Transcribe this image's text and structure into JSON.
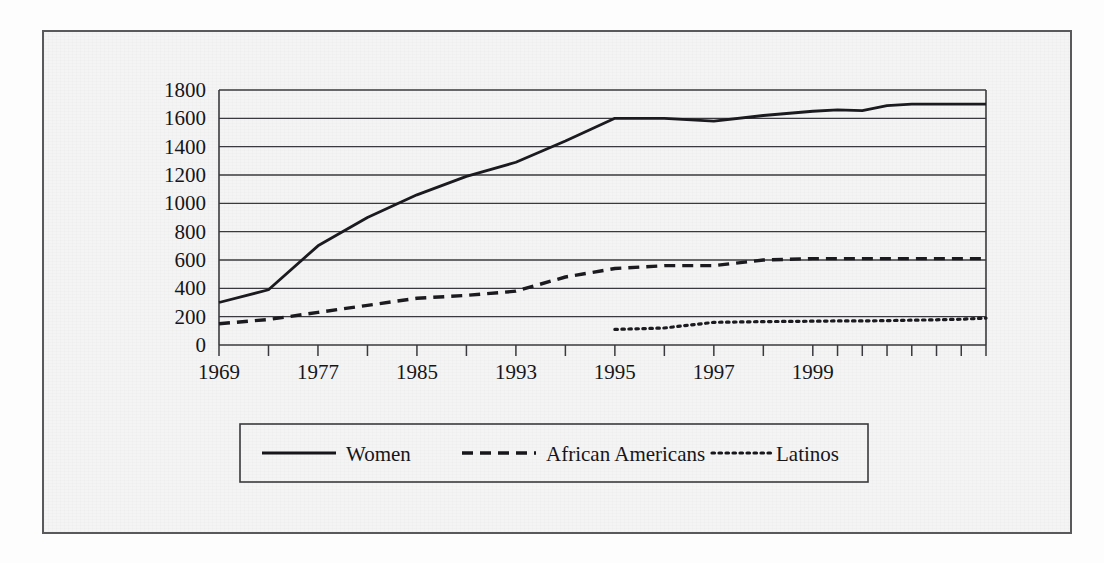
{
  "figure": {
    "background_color": "#f4f4f4",
    "frame_color": "#59595c",
    "gridline_color": "#3a3a3e",
    "text_color": "#16161a"
  },
  "chart_data": {
    "type": "line",
    "title": "",
    "xlabel": "",
    "ylabel": "",
    "ylim": [
      0,
      1800
    ],
    "ytick_values": [
      0,
      200,
      400,
      600,
      800,
      1000,
      1200,
      1400,
      1600,
      1800
    ],
    "ytick_labels": [
      "0",
      "200",
      "400",
      "600",
      "800",
      "1000",
      "1200",
      "1400",
      "1600",
      "1800"
    ],
    "grid": true,
    "grid_axis": "y",
    "legend_position": "bottom",
    "x": [
      1969,
      1971,
      1973,
      1975,
      1977,
      1979,
      1981,
      1983,
      1985,
      1987,
      1989,
      1991,
      1993,
      1994,
      1995,
      1996,
      1997,
      1998,
      1999,
      2000
    ],
    "xtick_values": [
      1969,
      1971,
      1973,
      1975,
      1977,
      1979,
      1981,
      1983,
      1985,
      1987,
      1989,
      1991,
      1993,
      1994,
      1995,
      1996,
      1997,
      1998,
      1999,
      2000
    ],
    "xtick_labels": [
      "1969",
      "",
      "1977",
      "",
      "1985",
      "",
      "1993",
      "",
      "1995",
      "",
      "1997",
      "",
      "1999",
      ""
    ],
    "xtick_labeled": [
      {
        "value": 1969,
        "label": "1969"
      },
      {
        "value": 1973,
        "label": "1977"
      },
      {
        "value": 1977,
        "label": "1985"
      },
      {
        "value": 1981,
        "label": "1993"
      },
      {
        "value": 1985,
        "label": "1995"
      },
      {
        "value": 1989,
        "label": "1997"
      },
      {
        "value": 1993,
        "label": "1999"
      }
    ],
    "series": [
      {
        "name": "Women",
        "style": "solid",
        "color": "#1b1b1f",
        "values": [
          300,
          390,
          700,
          900,
          1060,
          1190,
          1290,
          1440,
          1600,
          1600,
          1580,
          1620,
          1650,
          1660,
          1655,
          1690,
          1700,
          1700,
          1700,
          1700
        ]
      },
      {
        "name": "African Americans",
        "style": "dashed",
        "color": "#1b1b1f",
        "values": [
          150,
          180,
          230,
          280,
          330,
          350,
          380,
          480,
          540,
          560,
          560,
          600,
          610,
          610,
          610,
          610,
          610,
          610,
          610,
          610
        ]
      },
      {
        "name": "Latinos",
        "style": "dotted",
        "color": "#1b1b1f",
        "values": [
          null,
          null,
          null,
          null,
          null,
          null,
          null,
          null,
          110,
          120,
          160,
          165,
          168,
          170,
          170,
          172,
          175,
          178,
          182,
          190
        ]
      }
    ]
  },
  "legend": {
    "entries": [
      {
        "label": "Women",
        "style": "solid"
      },
      {
        "label": "African Americans",
        "style": "dashed"
      },
      {
        "label": "Latinos",
        "style": "dotted"
      }
    ]
  }
}
